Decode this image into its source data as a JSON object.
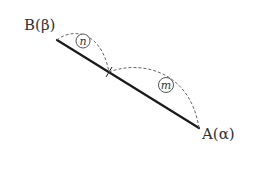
{
  "diagram": {
    "points": {
      "B": {
        "label": "B(β)",
        "x": 57,
        "y": 40
      },
      "A": {
        "label": "A(α)",
        "x": 199,
        "y": 128
      },
      "P": {
        "x": 109,
        "y": 72
      }
    },
    "segments": [
      {
        "from": "B",
        "to": "A",
        "style": "solid"
      }
    ],
    "arcs": [
      {
        "from": "B",
        "to": "P",
        "label": "n",
        "style": "dashed"
      },
      {
        "from": "P",
        "to": "A",
        "label": "m",
        "style": "dashed"
      }
    ],
    "labels": {
      "B": "B(β)",
      "A": "A(α)",
      "n": "n",
      "m": "m"
    },
    "colors": {
      "line": "#1a1a1a",
      "dash": "#666666",
      "text": "#333333"
    }
  }
}
